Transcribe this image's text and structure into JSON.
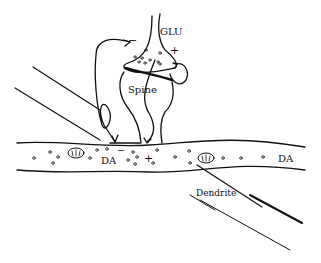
{
  "diagram": {
    "labels": {
      "glu": "GLU",
      "spine": "Spine",
      "da_left": "DA",
      "da_right": "DA",
      "dendrite": "Dendrite",
      "minus_top": "−",
      "plus_top": "+",
      "minus_synapse": "−",
      "plus_synapse": "+"
    },
    "components": [
      "glutamatergic terminal",
      "dendritic spine",
      "dopaminergic axon",
      "dendrite"
    ],
    "ink_color": "#111111"
  }
}
